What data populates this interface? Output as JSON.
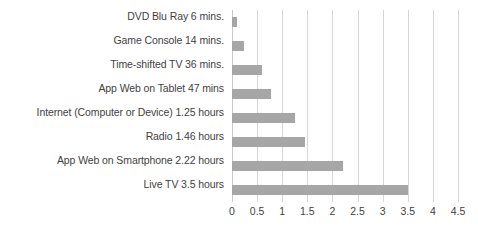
{
  "chart_data": {
    "type": "bar",
    "orientation": "horizontal",
    "title": "",
    "subtitle": "",
    "xlabel": "",
    "ylabel": "",
    "xlim": [
      0,
      4.5
    ],
    "grid": true,
    "legend": false,
    "bar_color": "#a6a6a6",
    "gridline_color": "#d6d6d6",
    "xticks": [
      "0",
      "0.5",
      "1",
      "1.5",
      "2",
      "2.5",
      "3",
      "3.5",
      "4",
      "4.5"
    ],
    "xtick_values": [
      0,
      0.5,
      1,
      1.5,
      2,
      2.5,
      3,
      3.5,
      4,
      4.5
    ],
    "categories": [
      "DVD Blu Ray 6 mins.",
      "Game Console 14 mins.",
      "Time-shifted TV 36 mins.",
      "App Web on Tablet 47 mins",
      "Internet (Computer or Device) 1.25 hours",
      "Radio 1.46 hours",
      "App Web on Smartphone 2.22 hours",
      "Live TV 3.5 hours"
    ],
    "values": [
      0.1,
      0.233,
      0.6,
      0.783,
      1.25,
      1.46,
      2.22,
      3.5
    ]
  }
}
